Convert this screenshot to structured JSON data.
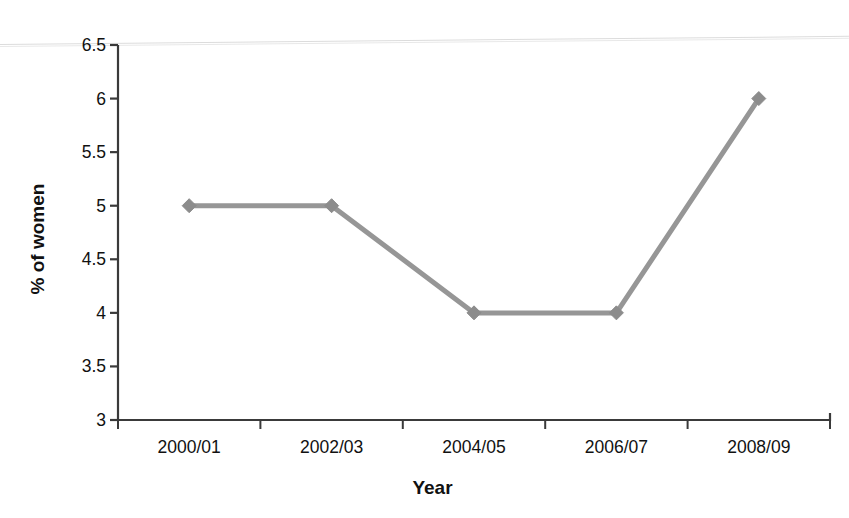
{
  "chart_data": {
    "type": "line",
    "title": "",
    "subtitle": "",
    "xlabel": "Year",
    "ylabel": "% of women",
    "categories": [
      "2000/01",
      "2002/03",
      "2004/05",
      "2006/07",
      "2008/09"
    ],
    "series": [
      {
        "name": "% of women",
        "values": [
          5,
          5,
          4,
          4,
          6
        ],
        "color": "#969696",
        "marker": "diamond",
        "marker_color": "#8c8c8c"
      }
    ],
    "ylim": [
      3,
      6.5
    ],
    "yticks": [
      3,
      3.5,
      4,
      4.5,
      5,
      5.5,
      6,
      6.5
    ],
    "ytick_labels": [
      "3",
      "3.5",
      "4",
      "4.5",
      "5",
      "5.5",
      "6",
      "6.5"
    ],
    "xtick_labels": [
      "2000/01",
      "2002/03",
      "2004/05",
      "2006/07",
      "2008/09"
    ],
    "grid": false,
    "legend": false,
    "legend_position": "none",
    "axis_color": "#3a3a3a"
  },
  "axes": {
    "y_title": "% of women",
    "x_title": "Year"
  }
}
